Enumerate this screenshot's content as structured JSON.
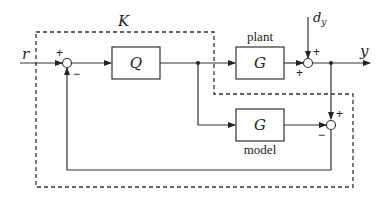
{
  "diagram": {
    "type": "block-diagram",
    "controller_label": "K",
    "blocks": {
      "Q": {
        "label": "Q"
      },
      "plant": {
        "label": "G",
        "caption": "plant"
      },
      "model": {
        "label": "G",
        "caption": "model"
      }
    },
    "signals": {
      "reference": "r",
      "output": "y",
      "disturbance_base": "d",
      "disturbance_sub": "y"
    },
    "summers": {
      "input": {
        "top": "+",
        "bottom": "−"
      },
      "output": {
        "top": "+",
        "left": "+"
      },
      "model": {
        "top": "+",
        "left": "−"
      }
    },
    "colors": {
      "line": "#333333",
      "background": "#ffffff"
    }
  }
}
